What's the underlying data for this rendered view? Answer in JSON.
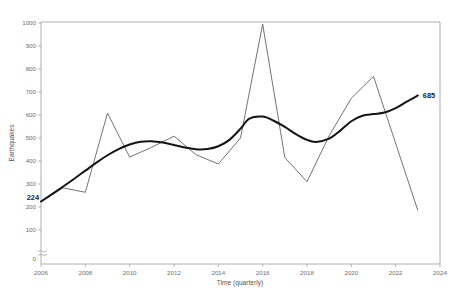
{
  "chart_data": {
    "type": "line",
    "title": "",
    "xlabel": "Time (quarterly)",
    "ylabel": "Earthquakes",
    "xlim": [
      2006,
      2024
    ],
    "ylim": [
      0,
      1000
    ],
    "xticks": [
      2006,
      2008,
      2010,
      2012,
      2014,
      2016,
      2018,
      2020,
      2022,
      2024
    ],
    "yticks": [
      0,
      100,
      200,
      300,
      400,
      500,
      600,
      700,
      800,
      900,
      1000
    ],
    "y_axis_break": true,
    "y_axis_break_note": "0",
    "grid": false,
    "legend": "none",
    "annotations": [
      {
        "name": "start-value",
        "text": "224",
        "x": 2006,
        "y": 224,
        "bold": true
      },
      {
        "name": "end-value",
        "text": "685",
        "x": 2023,
        "y": 685,
        "bold": true
      }
    ],
    "series": [
      {
        "name": "observed",
        "style": "thin-polyline",
        "color": "#5a5a60",
        "x": [
          2006,
          2007,
          2008,
          2009,
          2010,
          2011,
          2012,
          2013,
          2014,
          2015,
          2016,
          2017,
          2018,
          2019,
          2020,
          2021,
          2023
        ],
        "values": [
          224,
          283,
          264,
          608,
          417,
          460,
          508,
          427,
          387,
          500,
          995,
          415,
          310,
          510,
          673,
          768,
          185
        ]
      },
      {
        "name": "trend",
        "style": "thick-smooth",
        "color": "#141418",
        "x": [
          2006.0,
          2006.5,
          2007.0,
          2007.5,
          2008.0,
          2008.5,
          2009.0,
          2009.5,
          2010.0,
          2010.5,
          2011.0,
          2011.5,
          2012.0,
          2012.5,
          2013.0,
          2013.5,
          2014.0,
          2014.5,
          2015.0,
          2015.4,
          2016.0,
          2016.5,
          2017.0,
          2017.5,
          2018.0,
          2018.4,
          2019.0,
          2019.5,
          2020.0,
          2020.5,
          2021.0,
          2021.5,
          2022.0,
          2022.5,
          2023.0
        ],
        "values": [
          224,
          256,
          289,
          323,
          358,
          393,
          425,
          452,
          472,
          484,
          486,
          480,
          470,
          459,
          451,
          452,
          464,
          492,
          540,
          584,
          593,
          575,
          548,
          517,
          492,
          483,
          497,
          532,
          573,
          597,
          604,
          611,
          630,
          658,
          685
        ]
      }
    ]
  },
  "axis": {
    "y_tick_labels": [
      "1000",
      "900",
      "800",
      "700",
      "600",
      "500",
      "400",
      "300",
      "200",
      "100",
      "0"
    ],
    "x_tick_labels": [
      "2006",
      "2008",
      "2010",
      "2012",
      "2014",
      "2016",
      "2018",
      "2020",
      "2022",
      "2024"
    ],
    "y_title": "Earthquakes",
    "x_title": "Time (quarterly)"
  },
  "labels": {
    "start": "224",
    "end": "685"
  },
  "colors": {
    "observed_line": "#5a5a60",
    "trend_line": "#141418",
    "frame": "#9a9a9e",
    "tick_text": "#6f6f72",
    "background": "#ffffff"
  }
}
